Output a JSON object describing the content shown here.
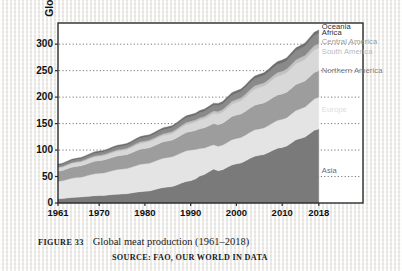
{
  "figure": {
    "number_label": "FIGURE 33",
    "title": "Global meat production (1961–2018)",
    "source": "SOURCE: FAO, OUR WORLD IN DATA"
  },
  "chart_data": {
    "type": "area",
    "stacked": true,
    "title": "Global meat production (1961–2018)",
    "xlabel": "",
    "ylabel": "Global meat production (million t)",
    "xlim": [
      1961,
      2018
    ],
    "ylim": [
      0,
      340
    ],
    "yticks": [
      0,
      50,
      100,
      150,
      200,
      250,
      300
    ],
    "xticks": [
      1961,
      1970,
      1980,
      1990,
      2000,
      2010,
      2018
    ],
    "grid": "horizontal-dotted",
    "legend_position": "inside-right",
    "x": [
      1961,
      1965,
      1970,
      1975,
      1980,
      1985,
      1990,
      1993,
      1995,
      1996,
      2000,
      2005,
      2010,
      2014,
      2018
    ],
    "series": [
      {
        "name": "Asia",
        "color": "#7a7a7a",
        "label_y_value": 60,
        "values": [
          8,
          11,
          14,
          17,
          22,
          30,
          42,
          54,
          64,
          61,
          74,
          90,
          105,
          122,
          140
        ]
      },
      {
        "name": "Europe",
        "color": "#e4e4e4",
        "label_y_value": 175,
        "values": [
          33,
          37,
          42,
          47,
          52,
          56,
          58,
          50,
          46,
          46,
          48,
          50,
          53,
          56,
          60
        ]
      },
      {
        "name": "Northern America",
        "color": "#9d9d9d",
        "label_y_value": 250,
        "values": [
          19,
          21,
          24,
          26,
          29,
          31,
          35,
          38,
          40,
          41,
          44,
          47,
          48,
          49,
          50
        ]
      },
      {
        "name": "South America",
        "color": "#d8d8d8",
        "label_y_value": 285,
        "values": [
          6,
          7,
          8,
          9,
          11,
          12,
          15,
          17,
          19,
          20,
          24,
          31,
          36,
          40,
          43
        ]
      },
      {
        "name": "Central America",
        "color": "#c2c2c2",
        "label_y_value": 305,
        "values": [
          1.5,
          1.8,
          2.2,
          2.6,
          3.2,
          3.6,
          4.2,
          4.6,
          4.9,
          5.0,
          5.6,
          6.3,
          7.0,
          7.6,
          8.2
        ]
      },
      {
        "name": "Africa",
        "color": "#8a8a8a",
        "label_y_value": 322,
        "values": [
          3.5,
          4,
          4.8,
          5.6,
          6.6,
          7.6,
          8.8,
          9.6,
          10.2,
          10.5,
          11.8,
          13.6,
          15.4,
          17.2,
          19.5
        ]
      },
      {
        "name": "Oceania",
        "color": "#6f6f6f",
        "label_y_value": 333,
        "values": [
          2.4,
          2.7,
          3.0,
          3.2,
          3.5,
          3.7,
          4.0,
          4.2,
          4.4,
          4.5,
          4.8,
          5.1,
          5.5,
          5.9,
          6.3
        ]
      }
    ],
    "legend_labels": [
      {
        "name": "Oceania",
        "color_text": "#2b2b2b"
      },
      {
        "name": "Africa",
        "color_text": "#2b2b2b"
      },
      {
        "name": "Central America",
        "color_text": "#9a9a9a"
      },
      {
        "name": "South America",
        "color_text": "#b9b9b9"
      },
      {
        "name": "Northern America",
        "color_text": "#7c7c7c"
      },
      {
        "name": "Europe",
        "color_text": "#dcdcdc"
      },
      {
        "name": "Asia",
        "color_text": "#6b6b6b"
      }
    ]
  }
}
